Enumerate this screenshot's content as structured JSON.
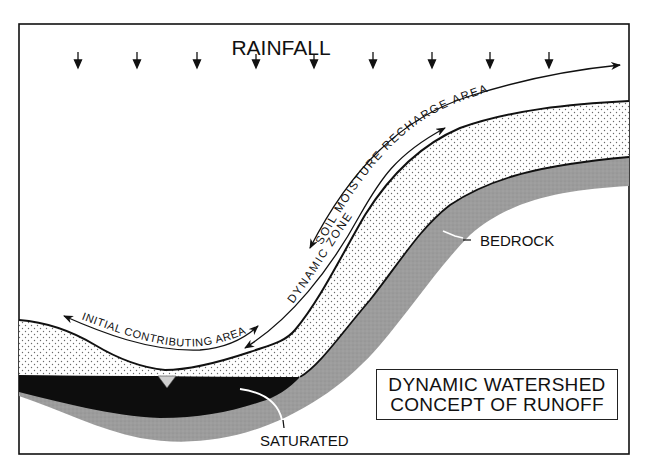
{
  "diagram": {
    "title": {
      "line1": "DYNAMIC WATERSHED",
      "line2": "CONCEPT OF RUNOFF"
    },
    "labels": {
      "rainfall": "RAINFALL",
      "soil_moisture_recharge_area": "SOIL MOISTURE RECHARGE AREA",
      "dynamic_zone": "DYNAMIC ZONE",
      "initial_contributing_area": "INITIAL CONTRIBUTING AREA",
      "bedrock": "BEDROCK",
      "saturated": "SATURATED"
    },
    "rain_arrow_count": 9,
    "colors": {
      "ink": "#111111",
      "soil_dots": "#555555",
      "bedrock": "#9a9a9a",
      "saturated": "#0d0d0d",
      "background": "#ffffff"
    }
  }
}
